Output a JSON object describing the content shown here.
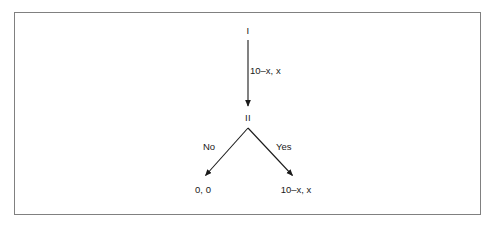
{
  "figure": {
    "type": "extensive-form-game-tree",
    "background_color": "#ffffff",
    "frame_color": "#808080",
    "ink_color": "#1a1a1a",
    "nodes": [
      {
        "id": "root",
        "label": "I",
        "x": 248,
        "y": 31
      },
      {
        "id": "second",
        "label": "II",
        "x": 248,
        "y": 118
      }
    ],
    "edges": [
      {
        "id": "offer",
        "from": "root",
        "to": "second",
        "label": "10–x, x",
        "label_x": 250,
        "label_y": 71
      },
      {
        "id": "reject",
        "from": "second",
        "to": "payoff-left",
        "label": "No",
        "label_x": 209,
        "label_y": 147
      },
      {
        "id": "accept",
        "from": "second",
        "to": "payoff-right",
        "label": "Yes",
        "label_x": 284,
        "label_y": 147
      }
    ],
    "payoffs": [
      {
        "id": "payoff-left",
        "label": "0, 0",
        "x": 203,
        "y": 190
      },
      {
        "id": "payoff-right",
        "label": "10–x, x",
        "x": 296,
        "y": 190
      }
    ]
  }
}
